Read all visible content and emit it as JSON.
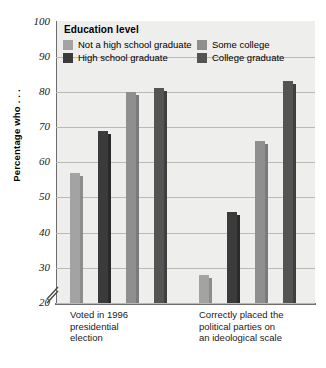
{
  "chart_data": {
    "type": "bar",
    "title": "",
    "xlabel": "",
    "ylabel": "Percentage who . . .",
    "ylim": [
      20,
      100
    ],
    "ystep": 10,
    "grid": true,
    "axis_break": true,
    "legend_position": "top-left-overlay",
    "legend_title": "Education level",
    "categories": [
      "Voted in 1996 presidential election",
      "Correctly placed the political parties on an ideological scale"
    ],
    "category_lines": [
      [
        "Voted in 1996",
        "presidential",
        "election"
      ],
      [
        "Correctly placed the",
        "political parties on",
        "an ideological scale"
      ]
    ],
    "series": [
      {
        "name": "Not a high school graduate",
        "color": "#a3a3a3",
        "shade": "#8d8d8d",
        "values": [
          57,
          28
        ]
      },
      {
        "name": "High school graduate",
        "color": "#3b3b3b",
        "shade": "#2a2a2a",
        "values": [
          69,
          46
        ]
      },
      {
        "name": "Some college",
        "color": "#8f8f8f",
        "shade": "#7a7a7a",
        "values": [
          80,
          66
        ]
      },
      {
        "name": "College graduate",
        "color": "#545454",
        "shade": "#3f3f3f",
        "values": [
          81,
          83
        ]
      }
    ],
    "ytick_labels": [
      "100",
      "90",
      "80",
      "70",
      "60",
      "50",
      "40",
      "30",
      "20"
    ],
    "ytick_values": [
      100,
      90,
      80,
      70,
      60,
      50,
      40,
      30,
      20
    ]
  }
}
